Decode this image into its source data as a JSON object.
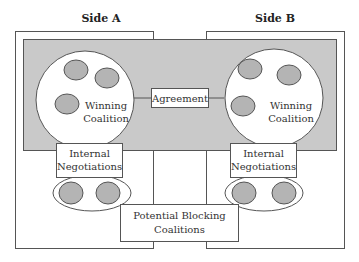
{
  "diagram": {
    "type": "two-level-game",
    "colors": {
      "shaded_area": "#c9c9c9",
      "small_circle_fill": "#b4b4b4",
      "stroke": "#555555",
      "background": "#ffffff"
    },
    "sides": [
      {
        "title": "Side A",
        "winning_coalition_label": [
          "Winning",
          "Coalition"
        ],
        "internal_label": [
          "Internal",
          "Negotiations"
        ]
      },
      {
        "title": "Side B",
        "winning_coalition_label": [
          "Winning",
          "Coalition"
        ],
        "internal_label": [
          "Internal",
          "Negotiations"
        ]
      }
    ],
    "agreement_label": "Agreement",
    "blocking_label": [
      "Potential Blocking",
      "Coalitions"
    ]
  }
}
